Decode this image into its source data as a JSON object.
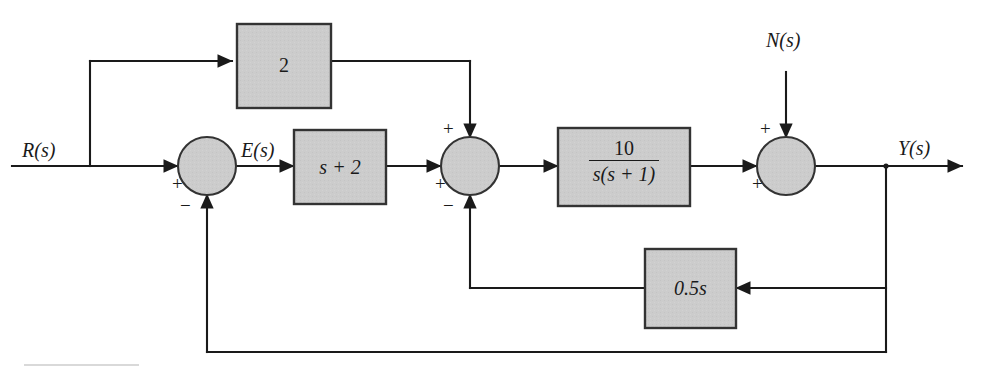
{
  "diagram": {
    "type": "control-system-block-diagram",
    "colors": {
      "line": "#1a1a1a",
      "block_fill": "#cccccc",
      "block_stroke": "#333333",
      "background": "#ffffff",
      "text": "#1a1a1a"
    },
    "signals": {
      "input_label": "R(s)",
      "error_label": "E(s)",
      "noise_label": "N(s)",
      "output_label": "Y(s)"
    },
    "blocks": [
      {
        "id": "gain-2",
        "label": "2",
        "label_html": "2"
      },
      {
        "id": "lead-s-plus-2",
        "label": "s + 2",
        "label_html": "s + 2"
      },
      {
        "id": "plant",
        "label": "10/(s(s+1))",
        "numerator": "10",
        "denominator": "s(s + 1)"
      },
      {
        "id": "rate-feedback",
        "label": "0.5s",
        "label_html": "0.5s"
      }
    ],
    "summing_junctions": [
      {
        "id": "sum-1",
        "signs": {
          "left": "+",
          "bottom": "−"
        }
      },
      {
        "id": "sum-2",
        "signs": {
          "top": "+",
          "left": "+",
          "bottom": "−"
        }
      },
      {
        "id": "sum-3",
        "signs": {
          "top": "+",
          "left": "+"
        }
      }
    ]
  }
}
